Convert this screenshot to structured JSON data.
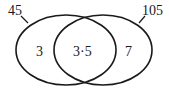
{
  "diagram": {
    "type": "venn",
    "sets": [
      {
        "id": "left",
        "label": "45"
      },
      {
        "id": "right",
        "label": "105"
      }
    ],
    "regions": {
      "left_only": "3",
      "intersection": "3·5",
      "right_only": "7"
    },
    "colors": {
      "stroke": "#1a1a1a",
      "background": "#ffffff"
    }
  }
}
